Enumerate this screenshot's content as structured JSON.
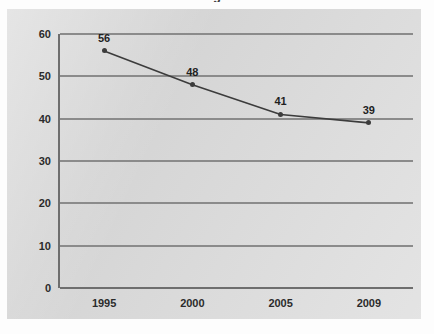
{
  "figure": {
    "title_fragment": "g",
    "background_color": "#fdfdfd",
    "panel_color": "#dcdcdc",
    "grid_color": "#8b8b8b",
    "axis_color": "#6e6e6e",
    "series_color": "#3c3c3c"
  },
  "chart_data": {
    "type": "line",
    "title": "",
    "xlabel": "",
    "ylabel": "",
    "categories": [
      "1995",
      "2000",
      "2005",
      "2009"
    ],
    "x": [
      1995,
      2000,
      2005,
      2009
    ],
    "values": [
      56,
      48,
      41,
      39
    ],
    "point_labels": [
      "56",
      "48",
      "41",
      "39"
    ],
    "series": [
      {
        "name": "",
        "values": [
          56,
          48,
          41,
          39
        ]
      }
    ],
    "ylim": [
      0,
      60
    ],
    "yticks": [
      "0",
      "10",
      "20",
      "30",
      "40",
      "50",
      "60"
    ],
    "ytick_values": [
      0,
      10,
      20,
      30,
      40,
      50,
      60
    ],
    "xticks": [
      "1995",
      "2000",
      "2005",
      "2009"
    ],
    "grid": true,
    "grid_axis": "y",
    "legend": false,
    "legend_position": "none",
    "markers": true,
    "marker_shape": "diamond"
  }
}
